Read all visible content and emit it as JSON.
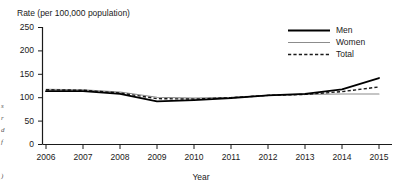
{
  "chart_data": {
    "type": "line",
    "title": "",
    "ylabel": "Rate (per 100,000 population)",
    "xlabel": "Year",
    "categories": [
      "2006",
      "2007",
      "2008",
      "2009",
      "2010",
      "2011",
      "2012",
      "2013",
      "2014",
      "2015"
    ],
    "x": [
      2006,
      2007,
      2008,
      2009,
      2010,
      2011,
      2012,
      2013,
      2014,
      2015
    ],
    "ylim": [
      0,
      250
    ],
    "yticks": [
      "0",
      "50",
      "100",
      "150",
      "200",
      "250"
    ],
    "ytick_values": [
      0,
      50,
      100,
      150,
      200,
      250
    ],
    "grid": false,
    "legend_position": "top-right",
    "series": [
      {
        "name": "Men",
        "style": "solid-thick-black",
        "color": "#000000",
        "values": [
          114,
          114,
          108,
          92,
          95,
          99,
          105,
          108,
          118,
          142
        ]
      },
      {
        "name": "Women",
        "style": "solid-thin-gray",
        "color": "#8c8c8c",
        "values": [
          118,
          117,
          112,
          101,
          99,
          101,
          105,
          107,
          108,
          108
        ]
      },
      {
        "name": "Total",
        "style": "dashed-black",
        "color": "#1a1a1a",
        "values": [
          117,
          116,
          110,
          98,
          97,
          100,
          105,
          107,
          113,
          123
        ]
      }
    ]
  },
  "legend": {
    "items": [
      {
        "label": "Men"
      },
      {
        "label": "Women"
      },
      {
        "label": "Total"
      }
    ]
  },
  "margin_notes": {
    "fragments": [
      "s",
      "r",
      "d",
      "f",
      ")"
    ]
  }
}
